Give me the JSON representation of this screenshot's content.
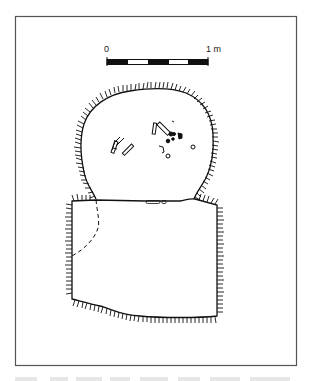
{
  "figure": {
    "type": "archaeological-plan-drawing",
    "frame_color": "#444444",
    "line_color": "#111111"
  },
  "scale_bar": {
    "start_label": "0",
    "end_label": "1 m",
    "segments": 5
  },
  "features": [
    {
      "name": "oval-pit",
      "description": "Rounded pit with hachured edge containing scattered finds"
    },
    {
      "name": "rectangular-pit",
      "description": "Rectangular cut with hachured edges and dashed internal boundary"
    }
  ],
  "caption": ""
}
